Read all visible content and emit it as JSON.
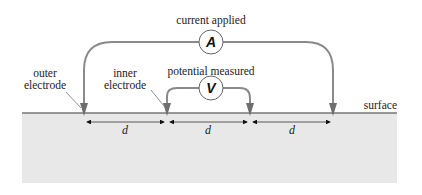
{
  "diagram": {
    "labels": {
      "current_applied": "current applied",
      "potential_measured": "potential measured",
      "outer_electrode_line1": "outer",
      "outer_electrode_line2": "electrode",
      "inner_electrode_line1": "inner",
      "inner_electrode_line2": "electrode",
      "surface": "surface"
    },
    "meters": {
      "ammeter": "A",
      "voltmeter": "V"
    },
    "spacings": [
      "d",
      "d",
      "d"
    ],
    "colors": {
      "ground": "#e8e8e8",
      "surface_line": "#777777",
      "wire": "#8a8a8a",
      "electrode": "#6e6e6e",
      "meter_stroke": "#666666",
      "text": "#222222"
    }
  }
}
